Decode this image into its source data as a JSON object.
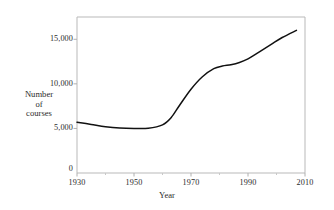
{
  "chart_data": {
    "type": "line",
    "title": "",
    "xlabel": "Year",
    "ylabel_lines": [
      "Number",
      "of",
      "courses"
    ],
    "ylabel": "Number of courses",
    "xlim": [
      1930,
      2010
    ],
    "ylim": [
      0,
      17500
    ],
    "grid": false,
    "legend": null,
    "line_color": "#111111",
    "axis_color": "#b9b9b9",
    "x_ticks_major": [
      1930,
      1950,
      1970,
      1990,
      2010
    ],
    "x_ticks_major_labels": [
      "1930",
      "1950",
      "1970",
      "1990",
      "2010"
    ],
    "x_ticks_minor": [
      1940,
      1960,
      1980,
      2000
    ],
    "y_ticks_major": [
      0,
      5000,
      10000,
      15000
    ],
    "y_ticks_major_labels": [
      "0",
      "5,000",
      "10,000",
      "15,000"
    ],
    "series": [
      {
        "name": "Number of courses",
        "x": [
          1930,
          1935,
          1940,
          1945,
          1950,
          1955,
          1960,
          1963,
          1966,
          1970,
          1974,
          1978,
          1981,
          1984,
          1987,
          1990,
          1994,
          1998,
          2002,
          2007
        ],
        "values": [
          5700,
          5450,
          5200,
          5050,
          5000,
          5020,
          5400,
          6200,
          7600,
          9400,
          10800,
          11700,
          12000,
          12150,
          12400,
          12800,
          13600,
          14400,
          15200,
          16000
        ]
      }
    ]
  }
}
